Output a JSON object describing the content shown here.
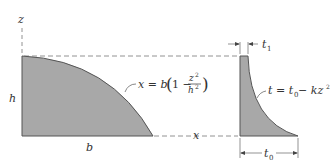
{
  "diagram": {
    "colors": {
      "fill": "#a8a8a8",
      "stroke": "#555555",
      "dash": "#666666",
      "text": "#333333",
      "background": "#ffffff"
    },
    "left_profile": {
      "axis_z_label": "z",
      "axis_x_label": "x",
      "height_label": "h",
      "width_label": "b",
      "equation": {
        "lhs": "x = b",
        "paren_open": "(",
        "one_minus": "1 −",
        "num": "z",
        "num_exp": "2",
        "den": "h",
        "den_exp": "2",
        "paren_close": ")"
      }
    },
    "right_profile": {
      "top_thickness_label": "t",
      "top_thickness_sub": "1",
      "base_thickness_label": "t",
      "base_thickness_sub": "0",
      "equation": {
        "lhs": "t = t",
        "lhs_sub": "0",
        "rhs": " − kz",
        "rhs_exp": "2"
      }
    }
  }
}
